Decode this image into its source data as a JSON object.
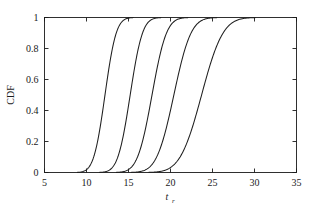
{
  "chart_data": {
    "type": "line",
    "title": "",
    "subtitle": "",
    "xlabel": "t_r",
    "xlabel_base": "t",
    "xlabel_sub": "r",
    "ylabel": "CDF",
    "xlim": [
      5,
      35
    ],
    "ylim": [
      0,
      1
    ],
    "xticks": [
      5,
      10,
      15,
      20,
      25,
      30,
      35
    ],
    "xticklabels": [
      "5",
      "10",
      "15",
      "20",
      "25",
      "30",
      "35"
    ],
    "yticks": [
      0,
      0.2,
      0.4,
      0.6,
      0.8,
      1
    ],
    "yticklabels": [
      "0",
      "0.2",
      "0.4",
      "0.6",
      "0.8",
      "1"
    ],
    "grid": false,
    "legend": null,
    "legend_position": "none",
    "line_color": "#1f1f1f",
    "series": [
      {
        "name": "curve-1",
        "distribution": "normal-cdf",
        "median": 12.2,
        "scale": 1.05,
        "x_at_cdf": {
          "0.01": 9.7,
          "0.1": 10.85,
          "0.25": 11.5,
          "0.5": 12.2,
          "0.75": 12.9,
          "0.9": 13.55,
          "0.99": 14.7
        }
      },
      {
        "name": "curve-2",
        "distribution": "normal-cdf",
        "median": 15.2,
        "scale": 1.15,
        "x_at_cdf": {
          "0.01": 12.5,
          "0.1": 13.72,
          "0.25": 14.42,
          "0.5": 15.2,
          "0.75": 15.98,
          "0.9": 16.68,
          "0.99": 17.9
        }
      },
      {
        "name": "curve-3",
        "distribution": "normal-cdf",
        "median": 17.8,
        "scale": 1.35,
        "x_at_cdf": {
          "0.01": 14.65,
          "0.1": 16.07,
          "0.25": 16.89,
          "0.5": 17.8,
          "0.75": 18.71,
          "0.9": 19.53,
          "0.99": 20.95
        }
      },
      {
        "name": "curve-4",
        "distribution": "normal-cdf",
        "median": 20.4,
        "scale": 1.6,
        "x_at_cdf": {
          "0.01": 16.68,
          "0.1": 18.35,
          "0.25": 19.32,
          "0.5": 20.4,
          "0.75": 21.48,
          "0.9": 22.45,
          "0.99": 24.12
        }
      },
      {
        "name": "curve-5",
        "distribution": "normal-cdf",
        "median": 23.7,
        "scale": 2.0,
        "x_at_cdf": {
          "0.01": 19.05,
          "0.1": 21.14,
          "0.25": 22.35,
          "0.5": 23.7,
          "0.75": 25.05,
          "0.9": 26.26,
          "0.99": 28.35
        }
      }
    ]
  },
  "figure": {
    "background": "#ffffff",
    "axis_color": "#1a1a1a"
  }
}
